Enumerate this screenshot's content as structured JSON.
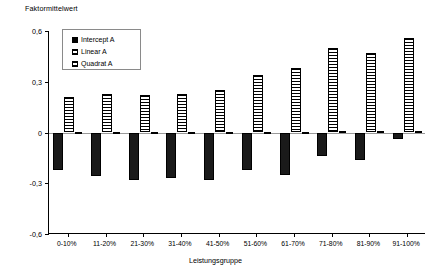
{
  "chart_data": {
    "type": "bar",
    "title": "",
    "ylabel": "Faktormittelwert",
    "xlabel": "Leistungsgruppe",
    "ylim": [
      -0.6,
      0.6
    ],
    "yticks": [
      0.6,
      0.3,
      0,
      -0.3,
      -0.6
    ],
    "ytick_labels": [
      "0,6",
      "0,3",
      "0",
      "-0,3",
      "-0,6"
    ],
    "grid": false,
    "legend_position": "upper-left-inside",
    "categories": [
      "0-10%",
      "11-20%",
      "21-30%",
      "31-40%",
      "41-50%",
      "51-60%",
      "61-70%",
      "71-80%",
      "81-90%",
      "91-100%"
    ],
    "series": [
      {
        "name": "Intercept A",
        "fill": "solid",
        "color": "#1a1a1a",
        "values": [
          -0.22,
          -0.26,
          -0.28,
          -0.27,
          -0.28,
          -0.22,
          -0.25,
          -0.14,
          -0.16,
          -0.04
        ]
      },
      {
        "name": "Linear A",
        "fill": "horizontal-lines",
        "color": "#000000",
        "values": [
          0.21,
          0.23,
          0.22,
          0.23,
          0.25,
          0.34,
          0.38,
          0.5,
          0.47,
          0.56
        ]
      },
      {
        "name": "Quadrat A",
        "fill": "grid",
        "color": "#000000",
        "values": [
          0.005,
          0.005,
          0.005,
          0.005,
          0.005,
          0.005,
          0.005,
          0.01,
          0.01,
          0.01
        ]
      }
    ]
  },
  "legend": {
    "items": [
      {
        "label": "Intercept A",
        "swatch": "solid-square-icon"
      },
      {
        "label": "Linear A",
        "swatch": "hlines-square-icon"
      },
      {
        "label": "Quadrat A",
        "swatch": "grid-square-icon"
      }
    ]
  }
}
